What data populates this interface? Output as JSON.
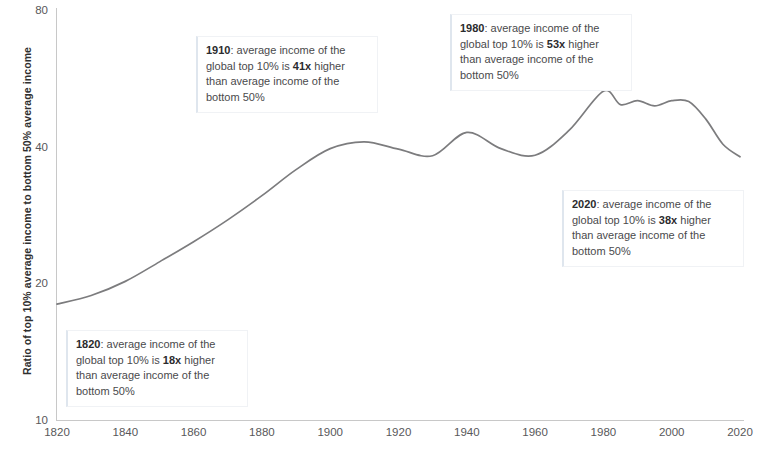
{
  "chart_data": {
    "type": "line",
    "title": "",
    "xlabel": "",
    "ylabel": "Ratio of top 10% average income to bottom 50% average income",
    "yscale": "log",
    "ylim": [
      10,
      80
    ],
    "xlim": [
      1820,
      2020
    ],
    "grid": false,
    "legend": "none",
    "y_ticks": [
      "80",
      "40",
      "20",
      "10"
    ],
    "y_tick_values": [
      80,
      40,
      20,
      10
    ],
    "x_ticks": [
      "1820",
      "1840",
      "1860",
      "1880",
      "1900",
      "1920",
      "1940",
      "1960",
      "1980",
      "2000",
      "2020"
    ],
    "x_tick_values": [
      1820,
      1840,
      1860,
      1880,
      1900,
      1920,
      1940,
      1960,
      1980,
      2000,
      2020
    ],
    "line_color": "#7c7c7e",
    "series": [
      {
        "name": "Ratio of top 10% to bottom 50% average income",
        "x": [
          1820,
          1830,
          1840,
          1850,
          1860,
          1870,
          1880,
          1890,
          1900,
          1910,
          1920,
          1930,
          1940,
          1950,
          1960,
          1970,
          1980,
          1985,
          1990,
          1995,
          2000,
          2005,
          2010,
          2015,
          2020
        ],
        "values": [
          18,
          18.8,
          20.2,
          22.3,
          24.7,
          27.6,
          31.2,
          35.6,
          39.6,
          41,
          39.5,
          38.2,
          43,
          39.6,
          38.3,
          43.5,
          53,
          49.5,
          50.5,
          49.2,
          50.5,
          50.3,
          46,
          40.5,
          38
        ]
      }
    ],
    "annotations": [
      {
        "id": "1820",
        "year": "1820",
        "multiple": "18x",
        "prefix": ": average income of the global top 10% is ",
        "suffix": " higher than average income of the bottom 50%",
        "full_text": "1820: average income of the global top 10% is 18x higher than average income of the bottom 50%"
      },
      {
        "id": "1910",
        "year": "1910",
        "multiple": "41x",
        "prefix": ": average income of the global top 10% is ",
        "suffix": " higher than average income of the bottom 50%",
        "full_text": "1910: average income of the global top 10% is 41x higher than average income of the bottom 50%"
      },
      {
        "id": "1980",
        "year": "1980",
        "multiple": "53x",
        "prefix": ": average income of the global top 10% is ",
        "suffix": " higher than average income of the bottom 50%",
        "full_text": "1980: average income of the global top 10% is 53x higher than average income of the bottom 50%"
      },
      {
        "id": "2020",
        "year": "2020",
        "multiple": "38x",
        "prefix": ": average income of the global top 10% is ",
        "suffix": " higher than average income of the bottom 50%",
        "full_text": "2020: average income of the global top 10% is 38x higher than average income of the bottom 50%"
      }
    ]
  }
}
